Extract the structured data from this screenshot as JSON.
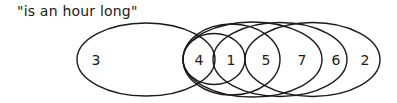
{
  "title": "\"is an hour long\"",
  "colors": {
    "stroke": "#1a1a1a",
    "background": "#ffffff"
  },
  "ellipses": [
    {
      "id": "set-3",
      "cx": 146,
      "cy": 59.5,
      "rx": 69,
      "ry": 36.5
    },
    {
      "id": "set-1",
      "cx": 214,
      "cy": 59,
      "rx": 31,
      "ry": 25.5
    },
    {
      "id": "set-5",
      "cx": 231.5,
      "cy": 59.5,
      "rx": 48.5,
      "ry": 35.5
    },
    {
      "id": "set-7",
      "cx": 252.5,
      "cy": 59.5,
      "rx": 69.5,
      "ry": 37.5
    },
    {
      "id": "set-6",
      "cx": 280,
      "cy": 59.5,
      "rx": 67,
      "ry": 37
    },
    {
      "id": "set-2",
      "cx": 312.5,
      "cy": 59.5,
      "rx": 67.5,
      "ry": 37
    }
  ],
  "labels": [
    {
      "text": "3",
      "x": 96,
      "y": 60
    },
    {
      "text": "4",
      "x": 199,
      "y": 60
    },
    {
      "text": "1",
      "x": 231,
      "y": 60
    },
    {
      "text": "5",
      "x": 266,
      "y": 60
    },
    {
      "text": "7",
      "x": 302,
      "y": 60
    },
    {
      "text": "6",
      "x": 336,
      "y": 60
    },
    {
      "text": "2",
      "x": 365,
      "y": 60
    }
  ]
}
